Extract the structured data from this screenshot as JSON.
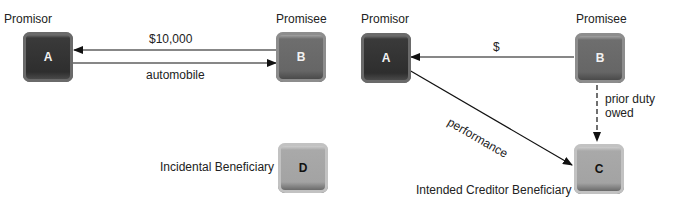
{
  "left_diagram": {
    "promisor_label": "Promisor",
    "promisee_label": "Promisee",
    "node_a": "A",
    "node_b": "B",
    "node_d": "D",
    "edge_b_to_a": "$10,000",
    "edge_a_to_b": "automobile",
    "incidental_label": "Incidental Beneficiary"
  },
  "right_diagram": {
    "promisor_label": "Promisor",
    "promisee_label": "Promisee",
    "node_a": "A",
    "node_b": "B",
    "node_c": "C",
    "edge_b_to_a": "$",
    "edge_a_to_c": "performance",
    "edge_b_to_c_line1": "prior duty",
    "edge_b_to_c_line2": "owed",
    "creditor_label": "Intended Creditor Beneficiary"
  }
}
